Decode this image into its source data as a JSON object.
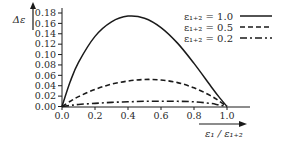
{
  "chart_data": {
    "type": "line",
    "title": "",
    "xlabel": "ε₁ / ε₁₊₂",
    "ylabel": "Δε",
    "xlim": [
      0.0,
      1.0
    ],
    "ylim": [
      0.0,
      0.18
    ],
    "x_ticks": [
      "0.0",
      "0.2",
      "0.4",
      "0.6",
      "0.8",
      "1.0"
    ],
    "y_ticks": [
      "0.00",
      "0.02",
      "0.04",
      "0.06",
      "0.08",
      "0.10",
      "0.12",
      "0.14",
      "0.16",
      "0.18"
    ],
    "grid": false,
    "legend_position": "upper right",
    "x": [
      0.0,
      0.05,
      0.1,
      0.2,
      0.3,
      0.4,
      0.5,
      0.6,
      0.7,
      0.8,
      0.9,
      0.95,
      1.0
    ],
    "series": [
      {
        "name": "ε₁₊₂ = 1.0",
        "style": "solid",
        "values": [
          0.0,
          0.048,
          0.085,
          0.135,
          0.163,
          0.174,
          0.17,
          0.152,
          0.122,
          0.083,
          0.04,
          0.019,
          0.0
        ]
      },
      {
        "name": "ε₁₊₂ = 0.5",
        "style": "dashed",
        "values": [
          0.0,
          0.01,
          0.019,
          0.033,
          0.043,
          0.049,
          0.052,
          0.051,
          0.046,
          0.036,
          0.021,
          0.011,
          0.0
        ]
      },
      {
        "name": "ε₁₊₂ = 0.2",
        "style": "dash-dot",
        "values": [
          0.0,
          0.002,
          0.004,
          0.006,
          0.008,
          0.009,
          0.01,
          0.01,
          0.01,
          0.009,
          0.006,
          0.003,
          0.0
        ]
      }
    ]
  },
  "legend": {
    "items": [
      {
        "label": "ε₁₊₂ = 1.0",
        "style": "solid"
      },
      {
        "label": "ε₁₊₂ = 0.5",
        "style": "dashed"
      },
      {
        "label": "ε₁₊₂ = 0.2",
        "style": "dash-dot"
      }
    ]
  },
  "axes": {
    "ylabel": "Δε",
    "xlabel": "ε₁ / ε₁₊₂"
  },
  "colors": {
    "line": "#1a1a1a",
    "text": "#2a2a2a"
  }
}
